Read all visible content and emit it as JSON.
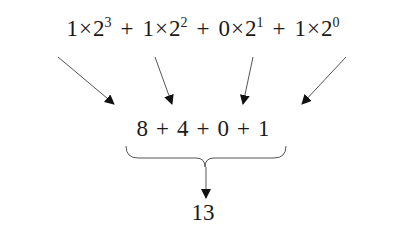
{
  "diagram": {
    "title": "",
    "top_terms": [
      {
        "coef": "1",
        "base": "2",
        "exp": "3"
      },
      {
        "coef": "1",
        "base": "2",
        "exp": "2"
      },
      {
        "coef": "0",
        "base": "2",
        "exp": "1"
      },
      {
        "coef": "1",
        "base": "2",
        "exp": "0"
      }
    ],
    "times_symbol": "×",
    "plus_symbol": "+",
    "middle_values": [
      "8",
      "4",
      "0",
      "1"
    ],
    "result": "13",
    "colors": {
      "text": "#1a1a1a",
      "arrow": "#555555",
      "arrowhead": "#111111"
    }
  }
}
